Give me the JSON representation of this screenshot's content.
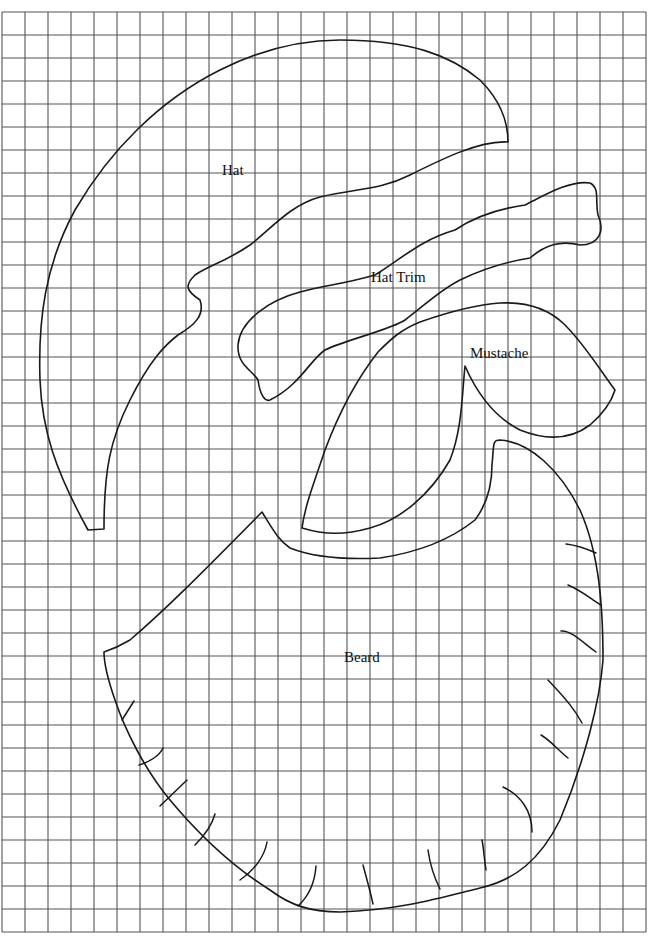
{
  "page": {
    "background": "#ffffff",
    "line_color": "#1a1a1a",
    "grid_color": "#555555"
  },
  "grid": {
    "x_start": 2,
    "y_start": 12,
    "cell_size": 23,
    "columns": 28,
    "rows": 40
  },
  "pieces": [
    {
      "id": "hat",
      "label": "Hat",
      "label_x": 222,
      "label_y": 175
    },
    {
      "id": "hat-trim",
      "label": "Hat Trim",
      "label_x": 371,
      "label_y": 282
    },
    {
      "id": "mustache",
      "label": "Mustache",
      "label_x": 470,
      "label_y": 358
    },
    {
      "id": "beard",
      "label": "Beard",
      "label_x": 344,
      "label_y": 662
    }
  ],
  "labels": {
    "hat": "Hat",
    "hat_trim": "Hat Trim",
    "mustache": "Mustache",
    "beard": "Beard"
  }
}
